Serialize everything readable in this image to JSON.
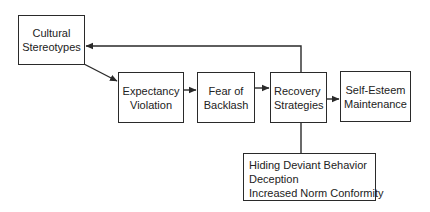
{
  "diagram": {
    "type": "flowchart",
    "nodes": [
      {
        "id": "cultural-stereotypes",
        "lines": [
          "Cultural",
          "Stereotypes"
        ]
      },
      {
        "id": "expectancy-violation",
        "lines": [
          "Expectancy",
          "Violation"
        ]
      },
      {
        "id": "fear-of-backlash",
        "lines": [
          "Fear of",
          "Backlash"
        ]
      },
      {
        "id": "recovery-strategies",
        "lines": [
          "Recovery",
          "Strategies"
        ]
      },
      {
        "id": "self-esteem-maintenance",
        "lines": [
          "Self-Esteem",
          "Maintenance"
        ]
      }
    ],
    "strategies_box": {
      "items": [
        "Hiding Deviant Behavior",
        "Deception",
        "Increased Norm Conformity"
      ]
    },
    "edges": [
      {
        "from": "cultural-stereotypes",
        "to": "expectancy-violation",
        "arrow": true
      },
      {
        "from": "expectancy-violation",
        "to": "fear-of-backlash",
        "arrow": true
      },
      {
        "from": "fear-of-backlash",
        "to": "recovery-strategies",
        "arrow": true
      },
      {
        "from": "recovery-strategies",
        "to": "self-esteem-maintenance",
        "arrow": true
      },
      {
        "from": "recovery-strategies",
        "to": "cultural-stereotypes",
        "arrow": true,
        "route": "feedback-over-top"
      },
      {
        "from": "recovery-strategies",
        "to": "strategies-box",
        "arrow": false
      }
    ],
    "colors": {
      "stroke": "#2a2a2a",
      "background": "#ffffff",
      "text": "#222222"
    }
  }
}
